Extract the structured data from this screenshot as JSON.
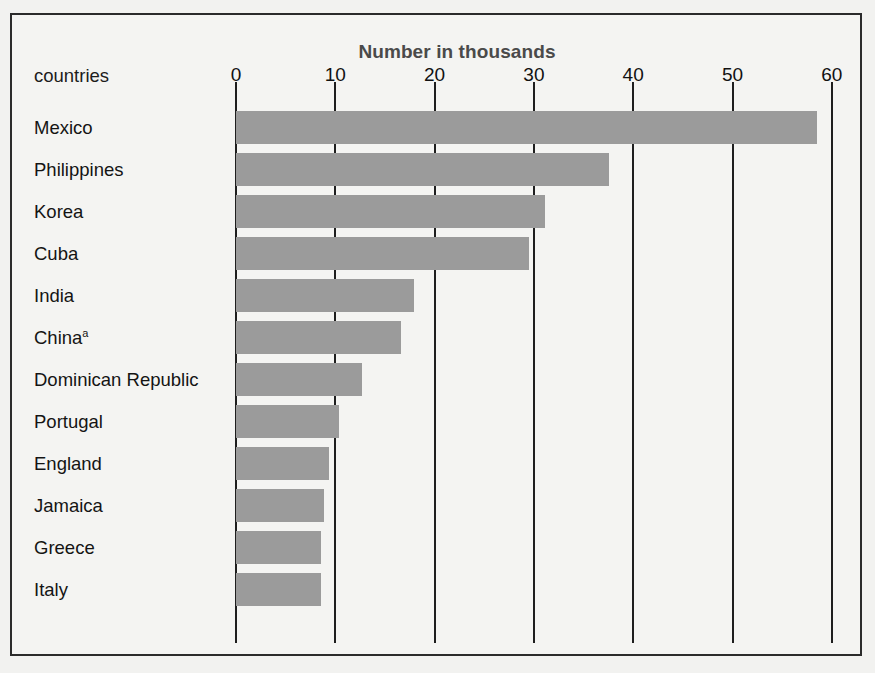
{
  "figure": {
    "axis_title": "Number in thousands",
    "category_axis_label": "countries",
    "footnote": ""
  },
  "chart_data": {
    "type": "bar",
    "orientation": "horizontal",
    "title": "Number in thousands",
    "xlabel": "Number in thousands",
    "ylabel": "countries",
    "xlim": [
      0,
      60
    ],
    "xticks": [
      0,
      10,
      20,
      30,
      40,
      50,
      60
    ],
    "xtick_labels": [
      "0",
      "10",
      "20",
      "30",
      "40",
      "50",
      "60"
    ],
    "grid": true,
    "legend": "none",
    "bar_color": "#9b9b9b",
    "categories": [
      "Mexico",
      "Philippines",
      "Korea",
      "Cuba",
      "India",
      "China",
      "Dominican Republic",
      "Portugal",
      "England",
      "Jamaica",
      "Greece",
      "Italy"
    ],
    "category_labels": [
      "Mexico",
      "Philippines",
      "Korea",
      "Cuba",
      "India",
      "China",
      "Dominican Republic",
      "Portugal",
      "England",
      "Jamaica",
      "Greece",
      "Italy"
    ],
    "category_footnote_markers": [
      "",
      "",
      "",
      "",
      "",
      "a",
      "",
      "",
      "",
      "",
      "",
      ""
    ],
    "values": [
      58.5,
      37.6,
      31.1,
      29.5,
      17.9,
      16.6,
      12.7,
      10.4,
      9.4,
      8.9,
      8.6,
      8.6
    ],
    "units": "thousands"
  }
}
